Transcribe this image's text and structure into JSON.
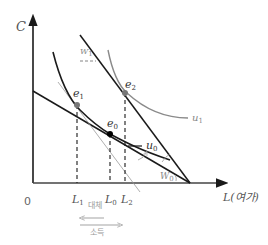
{
  "diagram": {
    "axes": {
      "y_label": "C",
      "x_label": "L(여가)",
      "origin_label": "0"
    },
    "points": {
      "e0": {
        "base": "e",
        "sub": "0"
      },
      "e1": {
        "base": "e",
        "sub": "1"
      },
      "e2": {
        "base": "e",
        "sub": "2"
      }
    },
    "curves": {
      "u0": {
        "base": "u",
        "sub": "0"
      },
      "u1": {
        "base": "u",
        "sub": "1"
      }
    },
    "wages": {
      "w0": {
        "base": "W",
        "sub": "0"
      },
      "w1": {
        "base": "W",
        "sub": "1"
      }
    },
    "x_ticks": {
      "l1": {
        "base": "L",
        "sub": "1"
      },
      "l0": {
        "base": "L",
        "sub": "0"
      },
      "l2": {
        "base": "L",
        "sub": "2"
      }
    },
    "effects": {
      "substitution": "대체",
      "income": "소득"
    },
    "colors": {
      "line_dark": "#1a1a1a",
      "line_gray": "#8a8a8a",
      "label_gray": "#999999"
    }
  }
}
